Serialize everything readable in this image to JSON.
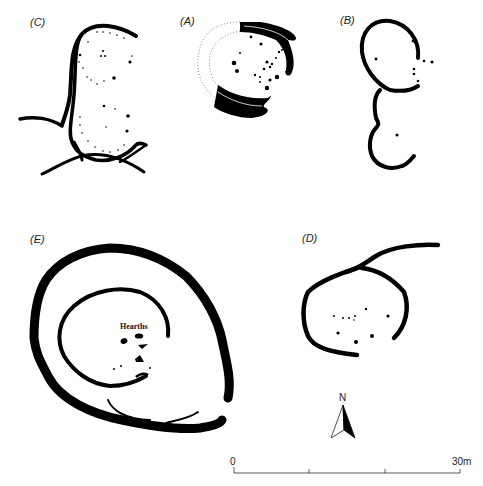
{
  "figure": {
    "plans": [
      {
        "id": "C",
        "label": "(C)"
      },
      {
        "id": "A",
        "label": "(A)"
      },
      {
        "id": "B",
        "label": "(B)"
      },
      {
        "id": "E",
        "label": "(E)",
        "annotation": "Hearths"
      },
      {
        "id": "D",
        "label": "(D)"
      }
    ],
    "north_arrow": {
      "label": "N"
    },
    "scale_bar": {
      "start_label": "0",
      "end_label": "30m",
      "divisions": 3
    }
  },
  "colors": {
    "ink": "#000000",
    "dotted_outline": "#888888",
    "background": "#ffffff"
  }
}
